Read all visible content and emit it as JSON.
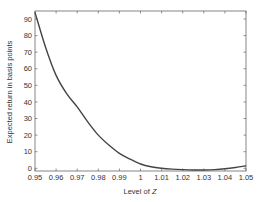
{
  "chart_data": {
    "type": "line",
    "title": "",
    "xlabel": "Level of ",
    "xlabel_var": "Z",
    "ylabel": "Expected return in basis points",
    "xlim": [
      0.95,
      1.05
    ],
    "ylim": [
      -2,
      95
    ],
    "xticks": [
      0.95,
      0.96,
      0.97,
      0.98,
      0.99,
      1,
      1.01,
      1.02,
      1.03,
      1.04,
      1.05
    ],
    "xtick_labels": [
      "0.95",
      "0.96",
      "0.97",
      "0.98",
      "0.99",
      "1",
      "1.01",
      "1.02",
      "1.03",
      "1.04",
      "1.05"
    ],
    "yticks": [
      0,
      10,
      20,
      30,
      40,
      50,
      60,
      70,
      80,
      90
    ],
    "ytick_labels": [
      "0",
      "10",
      "20",
      "30",
      "40",
      "50",
      "60",
      "70",
      "80",
      "90"
    ],
    "grid": false,
    "legend": null,
    "series": [
      {
        "name": "Expected return",
        "x": [
          0.95,
          0.955,
          0.96,
          0.965,
          0.97,
          0.975,
          0.98,
          0.985,
          0.99,
          0.995,
          1.0,
          1.005,
          1.01,
          1.015,
          1.02,
          1.025,
          1.03,
          1.035,
          1.04,
          1.045,
          1.05
        ],
        "values": [
          94,
          73,
          56,
          45,
          37,
          28,
          20,
          14,
          9,
          5.5,
          2.6,
          0.9,
          0,
          -0.5,
          -0.8,
          -1,
          -1,
          -0.8,
          -0.3,
          0.5,
          1.5
        ]
      }
    ]
  },
  "colors": {
    "line": "#444444",
    "axis": "#666666",
    "text": "#333333"
  }
}
